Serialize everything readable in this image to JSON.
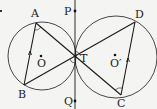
{
  "diagram": {
    "type": "geometry",
    "background": "#f4f4f2",
    "stroke_color": "#1a1a1a",
    "circles": [
      {
        "name": "O",
        "center": [
          42,
          56
        ],
        "radius": 34
      },
      {
        "name": "O'",
        "center": [
          116,
          57
        ],
        "radius": 41
      }
    ],
    "points": {
      "A": [
        36,
        23
      ],
      "B": [
        24,
        85
      ],
      "C": [
        121,
        95
      ],
      "D": [
        135,
        22
      ],
      "T": [
        75,
        57
      ],
      "P": [
        75,
        11
      ],
      "Q": [
        75,
        101
      ],
      "O": [
        41,
        56
      ],
      "O'": [
        115,
        55
      ]
    },
    "labels": {
      "A": "A",
      "B": "B",
      "C": "C",
      "D": "D",
      "T": "T",
      "P": "P",
      "Q": "Q",
      "O": "O",
      "O_prime": "O′"
    },
    "segments": [
      "AB",
      "AC",
      "BD",
      "DC",
      "PQ"
    ]
  }
}
